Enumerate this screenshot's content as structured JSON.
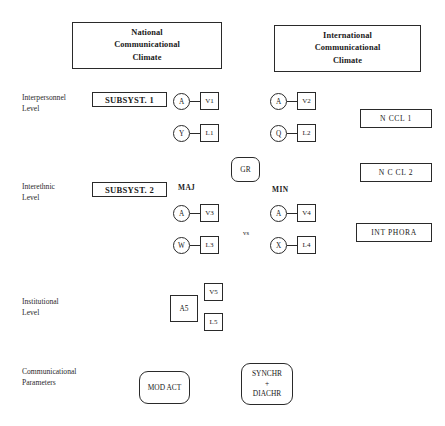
{
  "banners": {
    "national": "National\nCommunicational\nClimate",
    "national_lines": [
      "National",
      "Communicational",
      "Climate"
    ],
    "international_lines": [
      "International",
      "Communicational",
      "Climate"
    ]
  },
  "rows": {
    "interpersonnel": {
      "label_lines": [
        "Interpersonnel",
        "Level"
      ],
      "subsystem": "SUBSYST. 1",
      "left_pairs": [
        {
          "circle": "A",
          "box": "V1"
        },
        {
          "circle": "Y",
          "box": "L1"
        }
      ],
      "right_pairs": [
        {
          "circle": "A",
          "box": "V2"
        },
        {
          "circle": "Q",
          "box": "L2"
        }
      ],
      "outcome": "N CCL 1"
    },
    "interethnic": {
      "label_lines": [
        "Interethnic",
        "Level"
      ],
      "subsystem": "SUBSYST. 2",
      "maj_label": "MAJ",
      "min_label": "MIN",
      "vs_label": "vs",
      "left_pairs": [
        {
          "circle": "A",
          "box": "V3"
        },
        {
          "circle": "W",
          "box": "L3"
        }
      ],
      "right_pairs": [
        {
          "circle": "A",
          "box": "V4"
        },
        {
          "circle": "X",
          "box": "L4"
        }
      ],
      "outcome_top": "N C CL 2",
      "outcome_bottom": "INT PHORA"
    },
    "institutional": {
      "label_lines": [
        "Institutional",
        "Level"
      ],
      "actor": "A5",
      "boxes": [
        "V5",
        "L5"
      ]
    },
    "parameters": {
      "label_lines": [
        "Communicational",
        "Parameters"
      ],
      "mod_act": "MOD ACT",
      "synchr_diachr_lines": [
        "SYNCHR",
        "+",
        "DIACHR"
      ]
    }
  },
  "center": {
    "gr_label": "GR"
  },
  "colors": {
    "stroke": "#2a2a2a",
    "text": "#1a1a1a",
    "background": "#ffffff"
  }
}
